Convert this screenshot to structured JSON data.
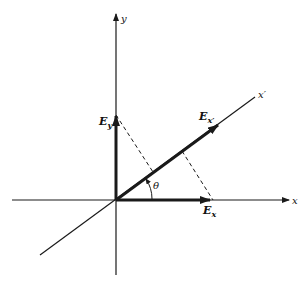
{
  "diagram": {
    "title": "",
    "colors": {
      "ink": "#1a1a1a",
      "background": "#ffffff"
    },
    "origin": [
      116,
      200
    ],
    "axes": {
      "x": {
        "label": "x",
        "from": [
          12,
          200
        ],
        "to": [
          289,
          200
        ]
      },
      "y": {
        "label": "y",
        "from": [
          116,
          275
        ],
        "to": [
          116,
          14
        ]
      },
      "x_prime": {
        "label": "x′",
        "from": [
          40,
          255
        ],
        "to": [
          255,
          97
        ]
      }
    },
    "vectors": {
      "E_x": {
        "label_main": "E",
        "label_sub": "x",
        "to": [
          210,
          200
        ]
      },
      "E_y": {
        "label_main": "E",
        "label_sub": "y",
        "to": [
          116,
          115
        ]
      },
      "E_x_prime": {
        "label_main": "E",
        "label_sub": "x′",
        "to": [
          218,
          125
        ]
      }
    },
    "angle": {
      "label": "θ",
      "between": [
        "x",
        "x′"
      ]
    },
    "projections": [
      {
        "from": [
          116,
          115
        ],
        "to": [
          153,
          172
        ],
        "style": "dashed"
      },
      {
        "from": [
          182,
          151
        ],
        "to": [
          213,
          200
        ],
        "style": "dashed"
      }
    ]
  }
}
